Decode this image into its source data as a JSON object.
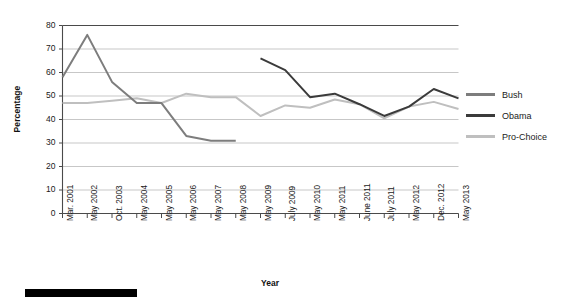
{
  "chart_data": {
    "type": "line",
    "title": "",
    "xlabel": "Year",
    "ylabel": "Percentage",
    "ylim": [
      0,
      80
    ],
    "ytick_step": 10,
    "yticks": [
      "80",
      "70",
      "60",
      "50",
      "40",
      "30",
      "20",
      "10",
      "0"
    ],
    "grid": "horizontal",
    "legend_position": "right",
    "categories": [
      "Mar. 2001",
      "May 2002",
      "Oct. 2003",
      "May 2004",
      "May 2005",
      "May 2006",
      "May 2007",
      "May 2008",
      "May 2009",
      "July 2009",
      "May 2010",
      "May 2011",
      "June 2011",
      "July 2011",
      "May 2012",
      "Dec. 2012",
      "May 2013"
    ],
    "series": [
      {
        "name": "Bush",
        "color": "#7d7d7d",
        "values": [
          58,
          76,
          56,
          47,
          47,
          33,
          31,
          31,
          null,
          null,
          null,
          null,
          null,
          null,
          null,
          null,
          null
        ]
      },
      {
        "name": "Obama",
        "color": "#3b3b3b",
        "values": [
          null,
          null,
          null,
          null,
          null,
          null,
          null,
          null,
          66,
          61,
          49.5,
          51,
          46.5,
          41.5,
          45.5,
          53,
          49
        ]
      },
      {
        "name": "Pro-Choice",
        "color": "#bfbfbf",
        "values": [
          47,
          47,
          48,
          49,
          47,
          51,
          49.5,
          49.5,
          41.5,
          46,
          45,
          48.5,
          46.5,
          40.5,
          45.5,
          47.5,
          44.5
        ]
      }
    ]
  },
  "legend": {
    "items": [
      {
        "label": "Bush",
        "color": "#7d7d7d"
      },
      {
        "label": "Obama",
        "color": "#3b3b3b"
      },
      {
        "label": "Pro-Choice",
        "color": "#bfbfbf"
      }
    ]
  },
  "axes": {
    "y_title": "Percentage",
    "x_title": "Year"
  },
  "caption_bar": {
    "color": "#000000"
  }
}
